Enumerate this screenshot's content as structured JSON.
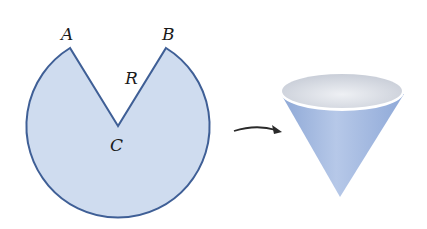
{
  "diagram": {
    "sector": {
      "labels": {
        "a": "A",
        "b": "B",
        "r": "R",
        "c": "C"
      },
      "fill": "#cfdcef",
      "stroke": "#3f5f96"
    },
    "arrow": {
      "color": "#2a2a2a"
    },
    "cone": {
      "body_color": "#9fb6de",
      "rim_color": "#ffffff",
      "inside_color": "#d7dbe3"
    }
  }
}
